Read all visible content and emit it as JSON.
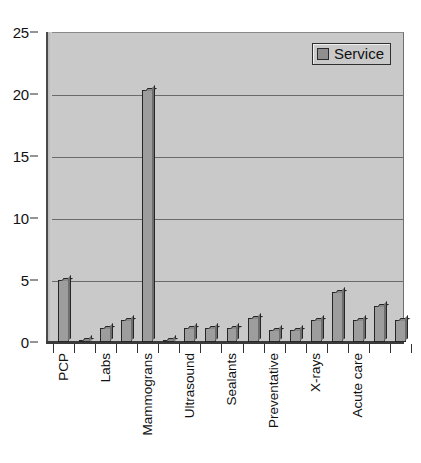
{
  "chart_data": {
    "type": "bar",
    "title": "",
    "xlabel": "",
    "ylabel": "",
    "ylim": [
      0,
      25
    ],
    "yticks": [
      0,
      5,
      10,
      15,
      20,
      25
    ],
    "grid": true,
    "legend_position": "top-right",
    "legend": [
      "Service"
    ],
    "series_name": "Service",
    "categories": [
      "PCP",
      "",
      "Labs",
      "",
      "Mammograns",
      "",
      "Ultrasound",
      "",
      "Sealants",
      "",
      "Preventative",
      "",
      "X-rays",
      "",
      "Acute care",
      "",
      ""
    ],
    "tick_labels_visible": [
      "PCP",
      "Labs",
      "Mammograns",
      "Ultrasound",
      "Sealants",
      "Preventative",
      "X-rays",
      "Acute care"
    ],
    "values": [
      5.0,
      0.2,
      1.1,
      1.8,
      20.3,
      0.2,
      1.1,
      1.1,
      1.1,
      1.9,
      1.0,
      1.0,
      1.8,
      4.0,
      1.8,
      2.9,
      1.8
    ],
    "series": [
      {
        "name": "Service",
        "values": [
          5.0,
          0.2,
          1.1,
          1.8,
          20.3,
          0.2,
          1.1,
          1.1,
          1.1,
          1.9,
          1.0,
          1.0,
          1.8,
          4.0,
          1.8,
          2.9,
          1.8
        ]
      }
    ],
    "colors": {
      "bar_face": "#9d9d9d",
      "bar_side": "#6e6e6e",
      "bar_top": "#8a8a8a",
      "bar_edge": "#262626",
      "plot_background": "#c9c9c9",
      "gridline": "#6b6b6b",
      "axis": "#333333",
      "page_background": "#ffffff",
      "text": "#121212"
    }
  },
  "legend": {
    "label": "Service"
  },
  "axes": {
    "y": {
      "ticks": [
        "0",
        "5",
        "10",
        "15",
        "20",
        "25"
      ]
    }
  }
}
